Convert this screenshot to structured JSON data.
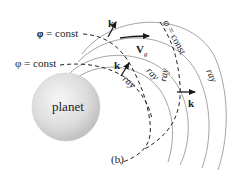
{
  "figure": {
    "caption": "(b)",
    "planet_label": "planet",
    "phase_labels": [
      {
        "text": "φ = const",
        "position": "upper-left"
      },
      {
        "text": "φ = const",
        "position": "middle-left"
      },
      {
        "text": "φ = const",
        "position": "upper-right-rotated"
      }
    ],
    "ray_labels": [
      "ray",
      "ray",
      "ray",
      "ray"
    ],
    "vectors": {
      "wave_vector": "k",
      "group_velocity": "V",
      "group_velocity_subscript": "g"
    },
    "colors": {
      "ray_line": "#9a9a9a",
      "phase_line": "#222222",
      "arrow": "#1a1a1a",
      "planet_light": "#f4f4f4",
      "planet_dark": "#bdbdbd"
    }
  }
}
